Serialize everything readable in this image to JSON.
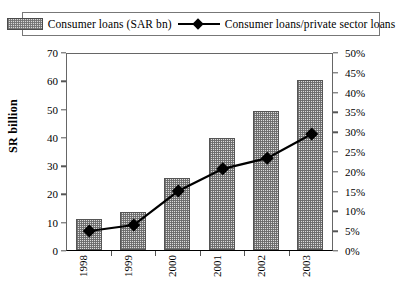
{
  "legend": {
    "items": [
      {
        "label": "Consumer loans (SAR bn)",
        "marker": "bar-swatch-hatched"
      },
      {
        "label": "Consumer loans/private sector loans",
        "marker": "line-diamond-swatch"
      }
    ]
  },
  "axes": {
    "left_title": "SR billion",
    "left_ticks": [
      "0",
      "10",
      "20",
      "30",
      "40",
      "50",
      "60",
      "70"
    ],
    "right_ticks": [
      "0%",
      "5%",
      "10%",
      "15%",
      "20%",
      "25%",
      "30%",
      "35%",
      "40%",
      "45%",
      "50%"
    ]
  },
  "chart_data": {
    "type": "bar",
    "title": "",
    "xlabel": "",
    "ylabel": "SR billion",
    "y2label": "",
    "categories": [
      "1998",
      "1999",
      "2000",
      "2001",
      "2002",
      "2003"
    ],
    "ylim": [
      0,
      70
    ],
    "y2lim": [
      0,
      50
    ],
    "grid": false,
    "legend_position": "top",
    "series": [
      {
        "name": "Consumer loans (SAR bn)",
        "type": "bar",
        "axis": "left",
        "unit": "SR bn",
        "color": "#dcdcdc",
        "values": [
          11,
          13.5,
          25.5,
          39.5,
          49,
          60
        ]
      },
      {
        "name": "Consumer loans/private sector loans",
        "type": "line",
        "axis": "right",
        "unit": "%",
        "color": "#000000",
        "values": [
          5.3,
          6.8,
          15.4,
          21.0,
          23.7,
          29.8
        ]
      }
    ]
  }
}
